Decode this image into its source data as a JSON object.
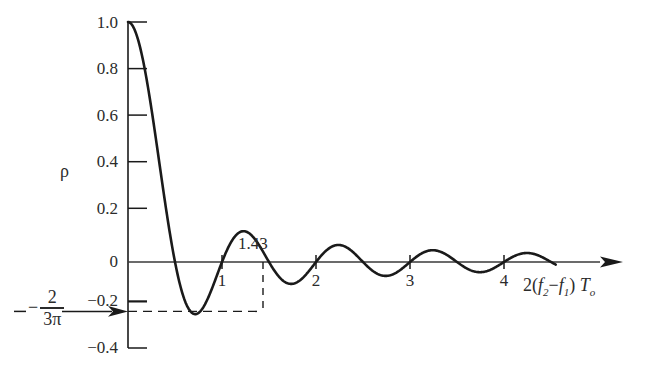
{
  "figure": {
    "background_color": "#ffffff",
    "ink_color": "#1a1a1a",
    "curve_color": "#1a1a1a"
  },
  "axes": {
    "y_axis_name": "ρ",
    "x_axis_title_prefix": "2(",
    "x_axis_title_f2": "f",
    "x_axis_title_f2_sub": "2",
    "x_axis_title_minus": "−",
    "x_axis_title_f1": "f",
    "x_axis_title_f1_sub": "1",
    "x_axis_title_close": ")",
    "x_axis_title_T": "T",
    "x_axis_title_T_sub": "o",
    "x_axis_title_plain": "2(f2 − f1) To"
  },
  "annotations": {
    "minimum_x_label": "1.43",
    "minimum_y_fraction_sign": "−",
    "minimum_y_fraction_numerator": "2",
    "minimum_y_fraction_denominator": "3π"
  },
  "chart_data": {
    "type": "line",
    "title": "",
    "xlabel": "2(f2 − f1) To",
    "ylabel": "ρ",
    "xlim": [
      0,
      5.1
    ],
    "ylim": [
      -0.4,
      1.0
    ],
    "grid": false,
    "legend": null,
    "x_ticks": [
      1,
      2,
      3,
      4
    ],
    "x_tick_labels": [
      "1",
      "2",
      "3",
      "4"
    ],
    "y_ticks": [
      1.0,
      0.8,
      0.6,
      0.4,
      0.2,
      0,
      -0.2,
      -0.4
    ],
    "y_tick_labels": [
      "1.0",
      "0.8",
      "0.6",
      "0.4",
      "0.2",
      "0",
      "−0.2",
      "−0.4"
    ],
    "function": "sinc: sin(2*pi*x)/(2*pi*x)",
    "annotations": [
      {
        "label": "1.43",
        "x": 1.43,
        "y": -0.2172,
        "type": "first-minimum-x-marker"
      },
      {
        "label": "-2/(3π)",
        "x": 0,
        "y": -0.2122,
        "type": "first-minimum-y-level"
      }
    ],
    "series": [
      {
        "name": "ρ",
        "x": [
          0,
          0.1,
          0.2,
          0.3,
          0.4,
          0.5,
          0.6,
          0.7,
          0.8,
          0.9,
          1.0,
          1.1,
          1.2,
          1.3,
          1.43,
          1.5,
          1.6,
          1.7,
          1.8,
          1.9,
          2.0,
          2.1,
          2.2,
          2.3,
          2.43,
          2.5,
          2.6,
          2.7,
          2.8,
          2.9,
          3.0,
          3.1,
          3.2,
          3.3,
          3.45,
          3.5,
          3.6,
          3.7,
          3.8,
          3.9,
          4.0,
          4.1,
          4.2,
          4.3,
          4.45,
          4.5
        ],
        "y": [
          1.0,
          0.9836,
          0.9355,
          0.8584,
          0.7568,
          0.6366,
          0.5046,
          0.3679,
          0.2339,
          0.1093,
          0.0,
          -0.0894,
          -0.1559,
          -0.1983,
          -0.2122,
          -0.2122,
          -0.1949,
          -0.158,
          -0.1093,
          -0.0532,
          0.0,
          0.0479,
          0.0827,
          0.1025,
          0.1087,
          0.1061,
          0.0929,
          0.0729,
          0.0486,
          0.0231,
          0.0,
          -0.0197,
          -0.0338,
          -0.042,
          -0.0435,
          -0.0431,
          -0.0371,
          -0.0281,
          -0.0173,
          -0.0062,
          0.0,
          0.0108,
          0.0202,
          0.0263,
          0.029,
          0.0289
        ],
        "style": "solid",
        "color": "#1a1a1a",
        "linewidth": 2.6
      }
    ]
  }
}
